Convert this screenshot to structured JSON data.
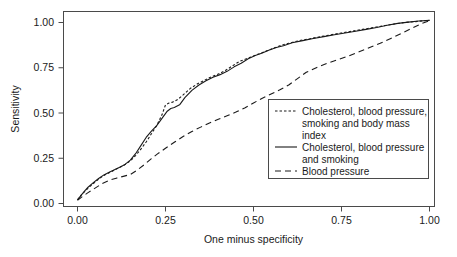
{
  "chart_data": {
    "type": "line",
    "title": "",
    "subtitle": "",
    "xlabel": "One minus specificity",
    "ylabel": "Sensitivity",
    "xlim": [
      0.0,
      1.0
    ],
    "ylim": [
      0.0,
      1.0
    ],
    "grid": false,
    "legend_position": "center-right",
    "xticks": [
      0.0,
      0.25,
      0.5,
      0.75,
      1.0
    ],
    "xtick_labels": [
      "0.00",
      "0.25",
      "0.50",
      "0.75",
      "1.00"
    ],
    "yticks": [
      0.0,
      0.25,
      0.5,
      0.75,
      1.0
    ],
    "ytick_labels": [
      "0.00",
      "0.25",
      "0.50",
      "0.75",
      "1.00"
    ],
    "series": [
      {
        "name": "Cholesterol, blood pressure, smoking and body mass index",
        "linestyle": "dotted",
        "color": "#1a1a1a",
        "x": [
          0.0,
          0.01,
          0.02,
          0.03,
          0.045,
          0.06,
          0.075,
          0.09,
          0.105,
          0.12,
          0.135,
          0.15,
          0.165,
          0.18,
          0.195,
          0.21,
          0.225,
          0.24,
          0.25,
          0.26,
          0.27,
          0.285,
          0.3,
          0.32,
          0.34,
          0.36,
          0.38,
          0.4,
          0.42,
          0.44,
          0.46,
          0.48,
          0.5,
          0.52,
          0.54,
          0.56,
          0.58,
          0.6,
          0.63,
          0.66,
          0.69,
          0.72,
          0.75,
          0.78,
          0.81,
          0.84,
          0.87,
          0.9,
          0.93,
          0.96,
          0.985,
          1.0
        ],
        "y": [
          0.02,
          0.045,
          0.065,
          0.085,
          0.11,
          0.135,
          0.155,
          0.17,
          0.185,
          0.2,
          0.215,
          0.235,
          0.265,
          0.3,
          0.34,
          0.385,
          0.43,
          0.49,
          0.545,
          0.555,
          0.56,
          0.575,
          0.6,
          0.635,
          0.66,
          0.68,
          0.7,
          0.715,
          0.735,
          0.76,
          0.785,
          0.8,
          0.815,
          0.83,
          0.845,
          0.86,
          0.875,
          0.885,
          0.9,
          0.91,
          0.922,
          0.932,
          0.942,
          0.952,
          0.962,
          0.972,
          0.982,
          0.992,
          1.0,
          1.005,
          1.01,
          1.012
        ]
      },
      {
        "name": "Cholesterol, blood pressure and smoking",
        "linestyle": "solid",
        "color": "#1a1a1a",
        "x": [
          0.0,
          0.01,
          0.02,
          0.03,
          0.045,
          0.06,
          0.075,
          0.09,
          0.105,
          0.12,
          0.135,
          0.15,
          0.165,
          0.18,
          0.195,
          0.21,
          0.225,
          0.24,
          0.255,
          0.265,
          0.275,
          0.29,
          0.305,
          0.325,
          0.345,
          0.365,
          0.385,
          0.405,
          0.425,
          0.445,
          0.465,
          0.485,
          0.505,
          0.525,
          0.545,
          0.565,
          0.585,
          0.61,
          0.64,
          0.67,
          0.7,
          0.73,
          0.76,
          0.79,
          0.82,
          0.85,
          0.88,
          0.91,
          0.94,
          0.97,
          1.0
        ],
        "y": [
          0.02,
          0.045,
          0.068,
          0.09,
          0.115,
          0.138,
          0.158,
          0.172,
          0.186,
          0.2,
          0.216,
          0.24,
          0.275,
          0.32,
          0.365,
          0.4,
          0.43,
          0.47,
          0.51,
          0.525,
          0.53,
          0.545,
          0.585,
          0.625,
          0.655,
          0.678,
          0.698,
          0.712,
          0.73,
          0.755,
          0.775,
          0.8,
          0.818,
          0.832,
          0.848,
          0.862,
          0.872,
          0.888,
          0.9,
          0.912,
          0.922,
          0.932,
          0.942,
          0.952,
          0.962,
          0.972,
          0.985,
          0.995,
          1.002,
          1.008,
          1.012
        ]
      },
      {
        "name": "Blood pressure",
        "linestyle": "dashed",
        "color": "#1a1a1a",
        "x": [
          0.0,
          0.015,
          0.03,
          0.05,
          0.07,
          0.09,
          0.11,
          0.13,
          0.15,
          0.17,
          0.19,
          0.21,
          0.23,
          0.25,
          0.275,
          0.3,
          0.325,
          0.35,
          0.375,
          0.4,
          0.425,
          0.45,
          0.475,
          0.5,
          0.525,
          0.55,
          0.575,
          0.6,
          0.625,
          0.65,
          0.68,
          0.71,
          0.74,
          0.77,
          0.8,
          0.83,
          0.86,
          0.89,
          0.92,
          0.95,
          0.975,
          1.0
        ],
        "y": [
          0.018,
          0.04,
          0.06,
          0.085,
          0.11,
          0.128,
          0.14,
          0.15,
          0.16,
          0.185,
          0.215,
          0.248,
          0.278,
          0.305,
          0.338,
          0.37,
          0.398,
          0.422,
          0.445,
          0.465,
          0.485,
          0.505,
          0.528,
          0.555,
          0.582,
          0.605,
          0.628,
          0.655,
          0.69,
          0.725,
          0.752,
          0.775,
          0.795,
          0.815,
          0.838,
          0.862,
          0.885,
          0.912,
          0.94,
          0.968,
          0.992,
          1.01
        ]
      }
    ],
    "legend_entries": [
      {
        "label_lines": [
          "Cholesterol, blood pressure,",
          "smoking and body mass",
          "index"
        ],
        "linestyle": "dotted"
      },
      {
        "label_lines": [
          "Cholesterol, blood pressure",
          "and smoking"
        ],
        "linestyle": "solid"
      },
      {
        "label_lines": [
          "Blood pressure"
        ],
        "linestyle": "dashed"
      }
    ]
  },
  "axes": {
    "x_title": "One minus specificity",
    "y_title": "Sensitivity",
    "x_labels": [
      "0.00",
      "0.25",
      "0.50",
      "0.75",
      "1.00"
    ],
    "y_labels": [
      "0.00",
      "0.25",
      "0.50",
      "0.75",
      "1.00"
    ]
  },
  "legend": {
    "entry1_line1": "Cholesterol, blood pressure,",
    "entry1_line2": "smoking and body mass",
    "entry1_line3": "index",
    "entry2_line1": "Cholesterol, blood pressure",
    "entry2_line2": "and smoking",
    "entry3_line1": "Blood pressure"
  },
  "colors": {
    "ink": "#1a1a1a",
    "frame": "#4a4a4a",
    "background": "#ffffff"
  }
}
